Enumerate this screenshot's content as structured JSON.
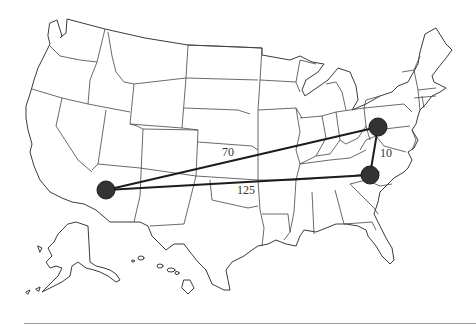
{
  "figure": {
    "type": "weighted-graph-on-us-map",
    "background": "#ffffff",
    "node_color": "#333333",
    "edge_color": "#1c1c1c"
  },
  "nodes": [
    {
      "id": "arizona",
      "x": 106,
      "y": 190,
      "r": 9
    },
    {
      "id": "pennsylvania-maryland",
      "x": 378,
      "y": 127,
      "r": 9
    },
    {
      "id": "north-carolina",
      "x": 370,
      "y": 175,
      "r": 9
    }
  ],
  "edges": [
    {
      "from": "arizona",
      "to": "pennsylvania-maryland",
      "weight": "70",
      "label_x": 222,
      "label_y": 146
    },
    {
      "from": "arizona",
      "to": "north-carolina",
      "weight": "125",
      "label_x": 237,
      "label_y": 184
    },
    {
      "from": "pennsylvania-maryland",
      "to": "north-carolina",
      "weight": "10",
      "label_x": 380,
      "label_y": 147
    }
  ],
  "labels": {
    "edge_az_pa": "70",
    "edge_az_nc": "125",
    "edge_pa_nc": "10"
  }
}
